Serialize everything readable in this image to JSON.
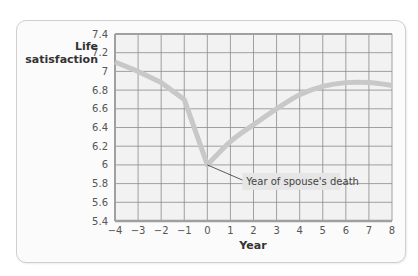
{
  "chart_data": {
    "type": "line",
    "title": "",
    "xlabel": "Year",
    "ylabel": "Life satisfaction",
    "ylabel_lines": [
      "Life",
      "satisfaction"
    ],
    "x": [
      -4,
      -3,
      -2,
      -1,
      0,
      1,
      2,
      3,
      4,
      5,
      6,
      7,
      8
    ],
    "series": [
      {
        "name": "Life satisfaction",
        "values": [
          7.1,
          7.0,
          6.88,
          6.7,
          6.0,
          6.25,
          6.43,
          6.6,
          6.75,
          6.84,
          6.88,
          6.88,
          6.85
        ]
      }
    ],
    "x_ticks": [
      "−4",
      "−3",
      "−2",
      "−1",
      "0",
      "1",
      "2",
      "3",
      "4",
      "5",
      "6",
      "7",
      "8"
    ],
    "y_ticks": [
      "7.4",
      "7.2",
      "7",
      "6.8",
      "6.6",
      "6.4",
      "6.2",
      "6",
      "5.8",
      "5.6",
      "5.4"
    ],
    "xlim": [
      -4,
      8
    ],
    "ylim": [
      5.4,
      7.4
    ],
    "grid": true,
    "legend": null,
    "annotations": [
      {
        "text": "Year of spouse's death",
        "x": 0,
        "y": 6.0
      }
    ],
    "colors": {
      "line": "#c8c8c8",
      "grid": "#8a8a8a",
      "axis": "#a0a0a0",
      "plot_bg": "#f2f2f2",
      "annotation_bg": "#e6e6e6"
    }
  }
}
